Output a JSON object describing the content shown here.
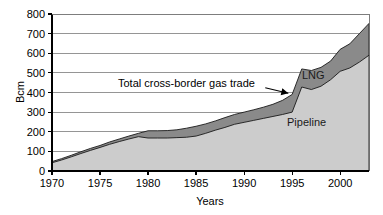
{
  "chart_data": {
    "type": "area",
    "title": "",
    "xlabel": "Years",
    "ylabel": "Bcm",
    "xlim": [
      1970,
      2003
    ],
    "ylim": [
      0,
      800
    ],
    "ytick_step": 100,
    "grid": "horizontal",
    "legend": "inline-labels",
    "xticks": [
      "1970",
      "1975",
      "1980",
      "1985",
      "1990",
      "1995",
      "2000"
    ],
    "xtick_values": [
      1970,
      1975,
      1980,
      1985,
      1990,
      1995,
      2000
    ],
    "yticks": [
      "0",
      "100",
      "200",
      "300",
      "400",
      "500",
      "600",
      "700",
      "800"
    ],
    "ytick_values": [
      0,
      100,
      200,
      300,
      400,
      500,
      600,
      700,
      800
    ],
    "x": [
      1970,
      1971,
      1972,
      1973,
      1974,
      1975,
      1976,
      1977,
      1978,
      1979,
      1980,
      1981,
      1982,
      1983,
      1984,
      1985,
      1986,
      1987,
      1988,
      1989,
      1990,
      1991,
      1992,
      1993,
      1994,
      1995,
      1996,
      1997,
      1998,
      1999,
      2000,
      2001,
      2002,
      2003
    ],
    "series": [
      {
        "name": "Total cross-border gas trade",
        "stacking": "top-boundary",
        "color": "#8a8a8a",
        "values": [
          48,
          63,
          80,
          98,
          115,
          130,
          148,
          163,
          178,
          192,
          205,
          205,
          206,
          210,
          218,
          228,
          240,
          255,
          272,
          288,
          300,
          312,
          325,
          340,
          360,
          390,
          520,
          512,
          528,
          560,
          620,
          648,
          700,
          752
        ]
      },
      {
        "name": "Pipeline",
        "stacking": "lower-band",
        "color": "#cccccc",
        "values": [
          42,
          56,
          72,
          89,
          105,
          120,
          136,
          150,
          163,
          175,
          168,
          168,
          168,
          170,
          172,
          178,
          192,
          208,
          222,
          238,
          248,
          258,
          268,
          278,
          288,
          300,
          428,
          415,
          432,
          465,
          508,
          525,
          555,
          590
        ]
      }
    ],
    "band_labels": [
      {
        "text": "LNG",
        "x": 1997.2,
        "y": 470
      },
      {
        "text": "Pipeline",
        "x": 1996.5,
        "y": 230
      }
    ],
    "annotations": [
      {
        "text": "Total cross-border gas trade",
        "text_x": 1984.0,
        "text_y": 430,
        "arrow_from_x": 1992.2,
        "arrow_from_y": 424,
        "arrow_to_x": 1994.6,
        "arrow_to_y": 396
      }
    ]
  }
}
